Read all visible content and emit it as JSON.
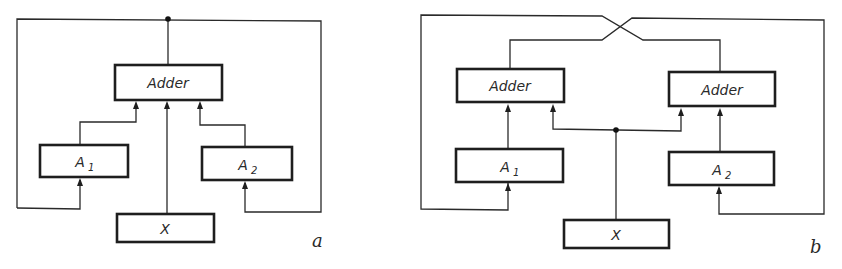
{
  "figure": {
    "panel_a": {
      "tag": "a",
      "adder": {
        "label": "Adder"
      },
      "a1": {
        "label": "A",
        "subscript": "1"
      },
      "a2": {
        "label": "A",
        "subscript": "2"
      },
      "x": {
        "label": "X"
      }
    },
    "panel_b": {
      "tag": "b",
      "adder_left": {
        "label": "Adder"
      },
      "adder_right": {
        "label": "Adder"
      },
      "a1": {
        "label": "A",
        "subscript": "1"
      },
      "a2": {
        "label": "A",
        "subscript": "2"
      },
      "x": {
        "label": "X"
      }
    },
    "colors": {
      "line": "#1e1e1e",
      "background": "#ffffff"
    }
  }
}
